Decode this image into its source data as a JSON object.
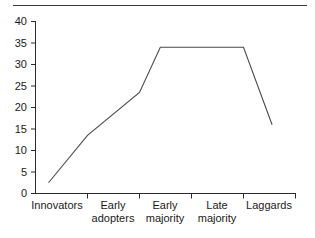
{
  "figure": {
    "top_rule_color": "#3a3a3a",
    "line_color": "#4a4a4a",
    "axis_color": "#2b2b2b",
    "background": "#ffffff"
  },
  "chart_data": {
    "type": "line",
    "title": "",
    "subtitle": "",
    "xlabel": "",
    "ylabel": "",
    "categories": [
      "Innovators",
      "Early\nadopters",
      "Early\nmajority",
      "Late\nmajority",
      "Laggards"
    ],
    "x_tick_labels": [
      "Innovators",
      "Early adopters",
      "Early majority",
      "Late majority",
      "Laggards"
    ],
    "y_tick_labels": [
      "0",
      "5",
      "10",
      "15",
      "20",
      "25",
      "30",
      "35",
      "40"
    ],
    "y_tick_values": [
      0,
      5,
      10,
      15,
      20,
      25,
      30,
      35,
      40
    ],
    "ylim": [
      0,
      40
    ],
    "grid": false,
    "legend": null,
    "series": [
      {
        "name": "Adoption",
        "points": [
          {
            "x": 0.25,
            "y": 2.5
          },
          {
            "x": 1.0,
            "y": 13.5
          },
          {
            "x": 2.0,
            "y": 23.5
          },
          {
            "x": 2.4,
            "y": 34.0
          },
          {
            "x": 4.0,
            "y": 34.0
          },
          {
            "x": 4.55,
            "y": 16.0
          }
        ],
        "values_at_categories": [
          2.5,
          13.5,
          23.5,
          34.0,
          16.0
        ]
      }
    ],
    "annotations": []
  }
}
